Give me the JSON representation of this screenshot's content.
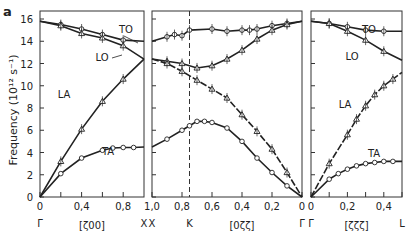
{
  "figure": {
    "panel_label": "a",
    "ylabel": "Frequency (10¹² s⁻¹)",
    "yticks": [
      0,
      2,
      4,
      6,
      8,
      10,
      12,
      14,
      16
    ],
    "ylim": [
      0,
      16.5
    ]
  },
  "chart_data": [
    {
      "type": "line",
      "direction": "[ζ00]",
      "xlabel": "[ζ00]",
      "x_start_label": "Γ",
      "x_end_label": "X",
      "xticks": [
        "0",
        "0,4",
        "0,8"
      ],
      "xlim": [
        0,
        1.0
      ],
      "series": [
        {
          "name": "TO",
          "x": [
            0,
            0.2,
            0.4,
            0.6,
            0.8,
            1.0
          ],
          "y": [
            15.8,
            15.5,
            15.1,
            14.6,
            14.1,
            14.0
          ]
        },
        {
          "name": "LO",
          "x": [
            0,
            0.2,
            0.4,
            0.6,
            0.8,
            1.0
          ],
          "y": [
            15.8,
            15.4,
            14.7,
            14.3,
            13.6,
            12.4
          ]
        },
        {
          "name": "LA",
          "x": [
            0,
            0.2,
            0.4,
            0.6,
            0.8,
            1.0
          ],
          "y": [
            0,
            3.2,
            6.1,
            8.6,
            10.6,
            12.4
          ]
        },
        {
          "name": "TA",
          "x": [
            0,
            0.2,
            0.4,
            0.6,
            0.7,
            0.8,
            0.9,
            1.0
          ],
          "y": [
            0,
            2.1,
            3.5,
            4.2,
            4.4,
            4.45,
            4.45,
            4.5
          ]
        }
      ]
    },
    {
      "type": "line",
      "direction": "[0ζζ]",
      "xlabel": "[0ζζ]",
      "x_start_label": "X",
      "x_mid_label": "K",
      "x_end_label": "Γ",
      "xticks": [
        "1,0",
        "0,8",
        "0,6",
        "0,4",
        "0,2",
        "0"
      ],
      "xlim": [
        1.0,
        0
      ],
      "k_point": 0.75,
      "series": [
        {
          "name": "TO",
          "x": [
            1.0,
            0.9,
            0.85,
            0.8,
            0.75,
            0.6,
            0.5,
            0.4,
            0.35,
            0.3,
            0.2,
            0.1,
            0
          ],
          "y": [
            14.0,
            14.4,
            14.6,
            14.5,
            15.0,
            15.1,
            14.9,
            15.0,
            15.0,
            15.1,
            15.4,
            15.6,
            15.8
          ]
        },
        {
          "name": "LO",
          "x": [
            1.0,
            0.9,
            0.8,
            0.7,
            0.6,
            0.5,
            0.4,
            0.3,
            0.2,
            0.1,
            0
          ],
          "y": [
            12.4,
            12.2,
            12.0,
            11.6,
            11.8,
            12.4,
            13.2,
            14.2,
            15.0,
            15.5,
            15.8
          ]
        },
        {
          "name": "LA",
          "x": [
            1.0,
            0.9,
            0.8,
            0.7,
            0.6,
            0.5,
            0.4,
            0.3,
            0.2,
            0.1,
            0
          ],
          "y": [
            12.4,
            12.0,
            11.3,
            10.5,
            9.7,
            8.9,
            7.4,
            5.9,
            4.3,
            2.2,
            0
          ]
        },
        {
          "name": "TA",
          "x": [
            1.0,
            0.9,
            0.8,
            0.75,
            0.7,
            0.65,
            0.6,
            0.5,
            0.4,
            0.3,
            0.2,
            0.1,
            0
          ],
          "y": [
            4.5,
            5.2,
            6.0,
            6.4,
            6.8,
            6.8,
            6.7,
            6.2,
            5.0,
            3.5,
            2.2,
            1.0,
            0
          ]
        }
      ]
    },
    {
      "type": "line",
      "direction": "[ζζζ]",
      "xlabel": "[ζζζ]",
      "x_start_label": "Γ",
      "x_end_label": "L",
      "xticks": [
        "0",
        "0,2",
        "0,4"
      ],
      "xlim": [
        0,
        0.5
      ],
      "series": [
        {
          "name": "TO",
          "x": [
            0,
            0.1,
            0.2,
            0.3,
            0.4,
            0.5
          ],
          "y": [
            15.8,
            15.6,
            15.3,
            15.0,
            14.9,
            14.9
          ]
        },
        {
          "name": "LO",
          "x": [
            0,
            0.1,
            0.2,
            0.3,
            0.4,
            0.5
          ],
          "y": [
            15.8,
            15.6,
            14.9,
            14.1,
            13.1,
            12.3
          ]
        },
        {
          "name": "LA",
          "x": [
            0,
            0.1,
            0.2,
            0.25,
            0.3,
            0.35,
            0.4,
            0.45,
            0.5
          ],
          "y": [
            0,
            3.0,
            5.6,
            7.0,
            8.2,
            9.2,
            10.0,
            10.6,
            11.2
          ]
        },
        {
          "name": "TA",
          "x": [
            0,
            0.1,
            0.15,
            0.2,
            0.25,
            0.3,
            0.35,
            0.4,
            0.45,
            0.5
          ],
          "y": [
            0,
            1.6,
            2.1,
            2.5,
            2.8,
            3.0,
            3.1,
            3.2,
            3.2,
            3.2
          ]
        }
      ]
    }
  ]
}
